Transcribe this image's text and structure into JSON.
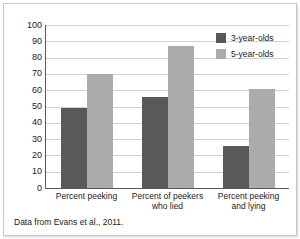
{
  "chart_data": {
    "type": "bar",
    "title": "",
    "xlabel": "",
    "ylabel": "",
    "ylim": [
      0,
      100
    ],
    "yticks": [
      0,
      10,
      20,
      30,
      40,
      50,
      60,
      70,
      80,
      90,
      100
    ],
    "grid": true,
    "legend_position": "top-right",
    "categories": [
      "Percent peeking",
      "Percent of peekers who lied",
      "Percent peeking and lying"
    ],
    "category_lines": [
      [
        "Percent peeking"
      ],
      [
        "Percent of peekers",
        "who lied"
      ],
      [
        "Percent peeking",
        "and lying"
      ]
    ],
    "series": [
      {
        "name": "3-year-olds",
        "color": "#595959",
        "values": [
          49,
          56,
          26
        ]
      },
      {
        "name": "5-year-olds",
        "color": "#ababab",
        "values": [
          70,
          87,
          61
        ]
      }
    ]
  },
  "legend": {
    "items": [
      {
        "label": "3-year-olds"
      },
      {
        "label": "5-year-olds"
      }
    ]
  },
  "source": {
    "note": "Data from Evans et al., 2011."
  }
}
